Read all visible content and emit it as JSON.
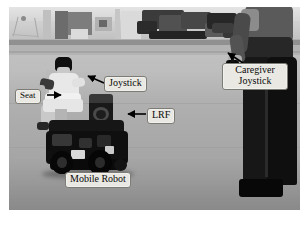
{
  "figure": {
    "kind": "annotated-photograph",
    "color_mode": "grayscale",
    "frame_background": "#ffffff"
  },
  "photo": {
    "scene": "indoor gymnasium floor with back wall, doorway panel and stacked dark equipment",
    "floor_color": "#b3b0a8",
    "wall_color": "#d8d6d0"
  },
  "annotations": {
    "box_fill": "#e9e8e2",
    "box_border": "#7d7b76",
    "text_color": "#0a0a0a",
    "arrow_color": "#000000",
    "labels": [
      {
        "id": "seat",
        "text": "Seat"
      },
      {
        "id": "joystick",
        "text": "Joystick"
      },
      {
        "id": "lrf",
        "text": "LRF"
      },
      {
        "id": "caregiver_joystick",
        "line1": "Caregiver",
        "line2": "Joystick"
      },
      {
        "id": "mobile_robot",
        "text": "Mobile Robot"
      }
    ]
  },
  "subjects": {
    "rider": "seated user",
    "caregiver": "standing caregiver holding handheld joystick",
    "robot": "mobile robot base with two drive wheels and caster"
  }
}
